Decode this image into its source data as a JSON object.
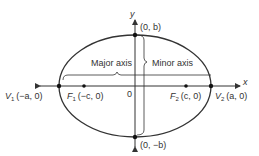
{
  "diagram": {
    "type": "ellipse",
    "center": {
      "x": 135,
      "y": 86
    },
    "semi_major_px": 76,
    "semi_minor_px": 51,
    "stroke_color": "#333333",
    "axes": {
      "x_label": "x",
      "y_label": "y",
      "origin_label": "0"
    },
    "points": [
      {
        "id": "V1",
        "name": "V",
        "sub": "1",
        "coords": "(−a, 0)",
        "x": 59,
        "y": 86
      },
      {
        "id": "F1",
        "name": "F",
        "sub": "1",
        "coords": "(−c, 0)",
        "x": 84,
        "y": 86
      },
      {
        "id": "F2",
        "name": "F",
        "sub": "2",
        "coords": "(c, 0)",
        "x": 186,
        "y": 86
      },
      {
        "id": "V2",
        "name": "V",
        "sub": "2",
        "coords": "(a, 0)",
        "x": 211,
        "y": 86
      },
      {
        "id": "top",
        "coords": "(0, b)",
        "x": 135,
        "y": 35
      },
      {
        "id": "bottom",
        "coords": "(0, −b)",
        "x": 135,
        "y": 137
      }
    ],
    "annotations": {
      "major_axis": "Major axis",
      "minor_axis": "Minor axis"
    }
  }
}
